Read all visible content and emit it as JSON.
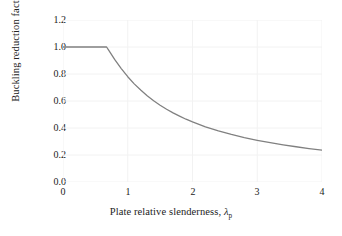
{
  "chart_data": {
    "type": "line",
    "title": "",
    "xlabel": "Plate relative slenderness, λ_p",
    "ylabel": "Buckling reduction factor, ρ",
    "xlabel_parts": {
      "text": "Plate relative slenderness, ",
      "symbol": "λ",
      "subscript": "p"
    },
    "ylabel_parts": {
      "text": "Buckling reduction factor, ",
      "symbol": "ρ"
    },
    "xlim": [
      0,
      4
    ],
    "ylim": [
      0,
      1.2
    ],
    "xticks": [
      "0",
      "1",
      "2",
      "3",
      "4"
    ],
    "xtick_values": [
      0,
      1,
      2,
      3,
      4
    ],
    "yticks": [
      "0.0",
      "0.2",
      "0.4",
      "0.6",
      "0.8",
      "1.0",
      "1.2"
    ],
    "ytick_values": [
      0.0,
      0.2,
      0.4,
      0.6,
      0.8,
      1.0,
      1.2
    ],
    "grid": true,
    "grid_color": "#f2f2f2",
    "legend": null,
    "line_color": "#808080",
    "line_width": 1.3,
    "plateau_limit": 0.673,
    "series": [
      {
        "name": "rho",
        "x": [
          0.0,
          0.2,
          0.4,
          0.6,
          0.673,
          0.7,
          0.8,
          0.9,
          1.0,
          1.1,
          1.2,
          1.3,
          1.4,
          1.5,
          1.6,
          1.7,
          1.8,
          1.9,
          2.0,
          2.2,
          2.4,
          2.6,
          2.8,
          3.0,
          3.2,
          3.4,
          3.6,
          3.8,
          4.0
        ],
        "y": [
          1.0,
          1.0,
          1.0,
          1.0,
          1.0,
          0.98,
          0.906,
          0.84,
          0.78,
          0.727,
          0.681,
          0.639,
          0.602,
          0.569,
          0.539,
          0.512,
          0.488,
          0.465,
          0.445,
          0.409,
          0.379,
          0.352,
          0.329,
          0.309,
          0.291,
          0.275,
          0.261,
          0.248,
          0.236
        ]
      }
    ],
    "endpoint_value": 0.236
  },
  "ylabel_ticks": [
    "1.2",
    "1.0",
    "0.8",
    "0.6",
    "0.4",
    "0.2",
    "0.0"
  ],
  "xlabel_ticks": [
    "0",
    "1",
    "2",
    "3",
    "4"
  ]
}
